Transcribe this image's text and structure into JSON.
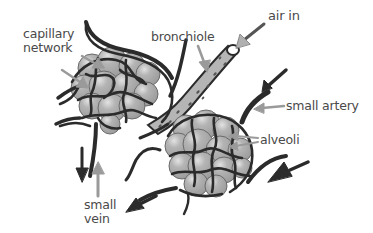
{
  "diagram": {
    "labels": {
      "capillary_network_line1": "capillary",
      "capillary_network_line2": "network",
      "bronchiole": "bronchiole",
      "air_in": "air in",
      "small_artery": "small artery",
      "alveoli": "alveoli",
      "small_vein_line1": "small",
      "small_vein_line2": "vein"
    },
    "colors": {
      "vessel": "#2b2b2b",
      "alveolus_fill": "#a9a9a9",
      "alveolus_highlight": "#d8d8d8",
      "bronchiole_fill": "#b5b5b5",
      "pointer_arrow": "#9a9a9a",
      "label_text": "#4a4a4a"
    }
  }
}
